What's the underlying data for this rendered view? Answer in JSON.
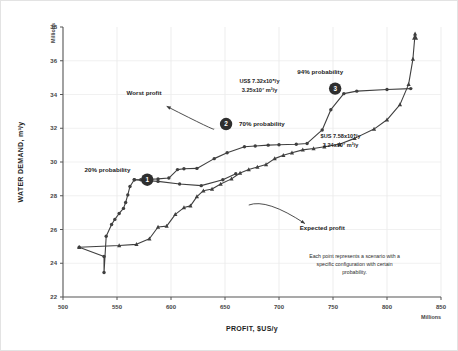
{
  "figure": {
    "background": "#ffffff",
    "frame_color": "#e3e3e3",
    "series_color": "#3f3f3f",
    "badge_color": "#2e2e2e"
  },
  "chart_data": {
    "type": "line",
    "title": "",
    "xlabel": "PROFIT, $US/y",
    "ylabel": "WATER DEMAND, m³/y",
    "x_unit_label": "Millions",
    "y_unit_label": "Millions",
    "xlim": [
      500,
      850
    ],
    "ylim": [
      22,
      38
    ],
    "xticks": [
      500,
      550,
      600,
      650,
      700,
      750,
      800,
      850
    ],
    "yticks": [
      22,
      24,
      26,
      28,
      30,
      32,
      34,
      36,
      38
    ],
    "grid": true,
    "legend": "none",
    "series": [
      {
        "name": "Worst profit frontier",
        "marker": "circle",
        "points": [
          [
            515,
            24.95
          ],
          [
            538,
            24.4
          ],
          [
            538,
            23.45
          ],
          [
            540,
            25.6
          ],
          [
            545,
            26.3
          ],
          [
            548,
            26.6
          ],
          [
            552,
            26.95
          ],
          [
            556,
            27.25
          ],
          [
            558,
            27.6
          ],
          [
            560,
            28.05
          ],
          [
            562,
            28.55
          ],
          [
            566,
            28.95
          ],
          [
            572,
            28.95
          ],
          [
            588,
            29.0
          ],
          [
            598,
            29.05
          ],
          [
            606,
            29.55
          ],
          [
            612,
            29.6
          ],
          [
            624,
            29.62
          ],
          [
            640,
            30.2
          ],
          [
            652,
            30.55
          ],
          [
            668,
            30.9
          ],
          [
            678,
            30.95
          ],
          [
            690,
            31.0
          ],
          [
            700,
            31.02
          ],
          [
            716,
            31.05
          ],
          [
            726,
            31.1
          ],
          [
            740,
            31.9
          ],
          [
            748,
            33.1
          ],
          [
            760,
            34.05
          ],
          [
            772,
            34.2
          ],
          [
            800,
            34.3
          ],
          [
            822,
            34.35
          ]
        ]
      },
      {
        "name": "Expected profit frontier",
        "marker": "triangle",
        "points": [
          [
            515,
            24.95
          ],
          [
            552,
            25.05
          ],
          [
            568,
            25.12
          ],
          [
            580,
            25.45
          ],
          [
            588,
            26.15
          ],
          [
            596,
            26.2
          ],
          [
            604,
            26.9
          ],
          [
            612,
            27.3
          ],
          [
            618,
            27.4
          ],
          [
            624,
            27.95
          ],
          [
            630,
            28.3
          ],
          [
            638,
            28.4
          ],
          [
            646,
            28.7
          ],
          [
            656,
            29.0
          ],
          [
            664,
            29.35
          ],
          [
            672,
            29.55
          ],
          [
            680,
            29.7
          ],
          [
            688,
            29.85
          ],
          [
            696,
            30.2
          ],
          [
            704,
            30.4
          ],
          [
            712,
            30.55
          ],
          [
            722,
            30.72
          ],
          [
            732,
            30.8
          ],
          [
            742,
            30.9
          ],
          [
            756,
            31.05
          ],
          [
            770,
            31.4
          ],
          [
            788,
            31.95
          ],
          [
            800,
            32.5
          ],
          [
            812,
            33.4
          ],
          [
            820,
            34.6
          ],
          [
            824,
            36.1
          ],
          [
            826,
            37.6
          ]
        ]
      },
      {
        "name": "Lower connector",
        "marker": "circle",
        "points": [
          [
            566,
            28.95
          ],
          [
            588,
            28.85
          ],
          [
            608,
            28.7
          ],
          [
            628,
            28.6
          ],
          [
            648,
            28.95
          ],
          [
            660,
            29.3
          ]
        ]
      }
    ],
    "annotations": [
      {
        "id": "worst-profit",
        "label": "Worst profit",
        "text_xy": [
          575,
          33.95
        ],
        "arrow_from": [
          640,
          31.95
        ],
        "arrow_to": [
          596,
          33.3
        ]
      },
      {
        "id": "expected-profit",
        "label": "Expected profit",
        "text_xy": [
          740,
          26.0
        ],
        "arrow_from": [
          672,
          27.45
        ],
        "arrow_to": [
          724,
          26.35
        ]
      },
      {
        "id": "prob-20",
        "badge": "1",
        "label": "20% probability",
        "badge_xy": [
          578,
          28.95
        ],
        "text_xy": [
          520,
          29.55
        ]
      },
      {
        "id": "prob-70",
        "badge": "2",
        "label": "70% probability",
        "badge_xy": [
          651,
          32.25
        ],
        "text_xy": [
          663,
          32.25
        ]
      },
      {
        "id": "prob-94",
        "badge": "3",
        "label": "94% probability",
        "badge_xy": [
          752,
          34.35
        ],
        "text_xy": [
          717,
          35.35
        ]
      }
    ],
    "value_labels": [
      {
        "id": "value-label-upper",
        "lines": [
          "US$ 7.32x10⁸/y",
          "3.25x10⁷ m³/y"
        ],
        "xy": [
          682,
          34.7
        ]
      },
      {
        "id": "value-label-lower",
        "lines": [
          "$US 7.58x10⁸/y",
          "3.24x10⁷ m³/y"
        ],
        "xy": [
          757,
          31.45
        ]
      }
    ],
    "caption": "Each point represents a scenario with a specific configuration with certain probability."
  }
}
